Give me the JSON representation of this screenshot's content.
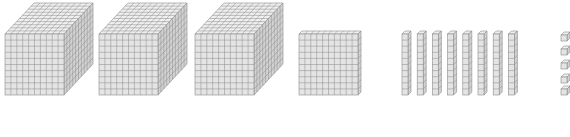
{
  "diagram": {
    "colors": {
      "face_front": "#e4e4e4",
      "face_top": "#efefef",
      "face_side": "#d2d2d2",
      "grid_line": "#8a8a8a",
      "background": "#ffffff"
    },
    "thousands": {
      "count": 3,
      "label": "thousand-cube"
    },
    "hundreds": {
      "count": 1,
      "label": "hundred-flat"
    },
    "tens": {
      "count": 8,
      "label": "ten-rod"
    },
    "ones": {
      "count": 5,
      "label": "unit-cube"
    },
    "value_represented": 3185
  }
}
